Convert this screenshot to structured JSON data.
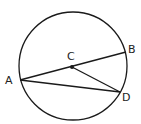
{
  "diagram": {
    "type": "circle-geometry",
    "stroke_color": "#1a1a1a",
    "circle": {
      "cx": 73,
      "cy": 66,
      "r": 54
    },
    "points": {
      "A": {
        "label": "A",
        "x": 20,
        "y": 80,
        "label_x": 5,
        "label_y": 84
      },
      "B": {
        "label": "B",
        "x": 126,
        "y": 52,
        "label_x": 128,
        "label_y": 53
      },
      "C": {
        "label": "C",
        "x": 72,
        "y": 67,
        "label_x": 67,
        "label_y": 60
      },
      "D": {
        "label": "D",
        "x": 120,
        "y": 92,
        "label_x": 122,
        "label_y": 101
      }
    },
    "segments": [
      {
        "from": "A",
        "to": "B",
        "name": "diameter-AB"
      },
      {
        "from": "C",
        "to": "D",
        "name": "radius-CD"
      },
      {
        "from": "A",
        "to": "D",
        "name": "chord-AD"
      }
    ]
  }
}
